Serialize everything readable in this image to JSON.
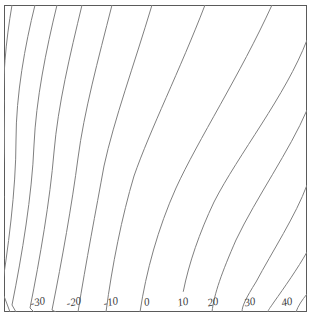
{
  "chart_data": {
    "type": "line",
    "title": "",
    "subtitle": "",
    "xlabel": "",
    "ylabel": "",
    "grid": false,
    "legend_position": "none",
    "plot_style": "contour",
    "contour_interval": 5,
    "labeled_interval": 10,
    "frame": {
      "x": 4,
      "y": 5,
      "width": 303,
      "height": 307
    },
    "axis_ranges": {
      "xlim": [
        0,
        1
      ],
      "ylim": [
        0,
        1
      ]
    },
    "labels": [
      {
        "text": "-30",
        "x": 38,
        "y": 303,
        "level": -30
      },
      {
        "text": "-20",
        "x": 74,
        "y": 303,
        "level": -20
      },
      {
        "text": "-10",
        "x": 111,
        "y": 303,
        "level": -10
      },
      {
        "text": "0",
        "x": 147,
        "y": 303,
        "level": 0
      },
      {
        "text": "10",
        "x": 183,
        "y": 303,
        "level": 10
      },
      {
        "text": "20",
        "x": 213,
        "y": 303,
        "level": 20
      },
      {
        "text": "30",
        "x": 250,
        "y": 303,
        "level": 30
      },
      {
        "text": "40",
        "x": 287,
        "y": 303,
        "level": 40
      }
    ],
    "contours": [
      {
        "level": -55,
        "labeled": false,
        "d": "M 4,150 L 4,150"
      },
      {
        "level": -50,
        "labeled": false,
        "d": "M 4,196 C 2,210 0,220 -4,232"
      },
      {
        "level": -45,
        "labeled": false,
        "d": "M 4,258 C 0,268 -3,276 -6,284"
      },
      {
        "level": -40,
        "labeled": false,
        "d": "M 4,296 L 10,312"
      },
      {
        "level": -35,
        "labeled": false,
        "d": "M 4,100 C 2,130 0,160 -2,190"
      },
      {
        "level": -30,
        "labeled": true,
        "d": "M 12,5 C 6,40 2,80 4,118 C 6,160 0,210 -6,250"
      },
      {
        "level": -25,
        "labeled": false,
        "d": "M 35,5 C 25,45 16,95 16,140 C 16,190 8,250 0,300 L 4,312"
      },
      {
        "level": -20,
        "labeled": true,
        "d": "M 57,5 C 46,50 36,100 34,145 C 32,195 22,255 12,305 L 16,312"
      },
      {
        "level": -15,
        "labeled": false,
        "d": "M 82,5 C 70,55 58,105 54,152 C 50,200 40,258 30,308 L 34,312"
      },
      {
        "level": -10,
        "labeled": true,
        "d": "M 112,5 C 98,60 84,112 78,158 C 72,204 62,260 52,310 L 56,312"
      },
      {
        "level": -5,
        "labeled": false,
        "d": "M 152,5 C 134,65 114,120 104,166 C 96,210 86,262 78,312"
      },
      {
        "level": 0,
        "labeled": true,
        "d": "M 205,5 C 180,70 150,130 134,176 C 122,216 112,266 106,312"
      },
      {
        "level": 5,
        "labeled": false,
        "d": "M 272,5 C 240,75 198,140 176,188 C 158,228 146,272 140,312"
      },
      {
        "level": 10,
        "labeled": true,
        "d": "M 307,40 C 286,95 238,155 214,202 C 196,240 184,278 180,312"
      },
      {
        "level": 15,
        "labeled": false,
        "d": "M 307,110 C 290,150 256,198 236,240 C 222,272 214,294 212,312"
      },
      {
        "level": 20,
        "labeled": true,
        "d": "M 307,185 C 296,215 272,252 256,282 C 246,298 242,306 242,312"
      },
      {
        "level": 25,
        "labeled": false,
        "d": "M 307,252 C 298,268 284,288 274,302 C 270,308 268,310 268,312"
      },
      {
        "level": 30,
        "labeled": true,
        "d": "M 307,294 C 302,300 298,306 296,312"
      }
    ]
  }
}
